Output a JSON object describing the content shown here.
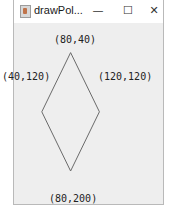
{
  "window": {
    "title": "drawPol...",
    "controls": {
      "minimize": "—",
      "maximize": "☐",
      "close": "✕"
    }
  },
  "canvas": {
    "stroke_color": "#6a6a6a",
    "polygon": [
      {
        "x": 80,
        "y": 40,
        "label": "(80,40)"
      },
      {
        "x": 120,
        "y": 120,
        "label": "(120,120)"
      },
      {
        "x": 80,
        "y": 200,
        "label": "(80,200)"
      },
      {
        "x": 40,
        "y": 120,
        "label": "(40,120)"
      }
    ]
  }
}
